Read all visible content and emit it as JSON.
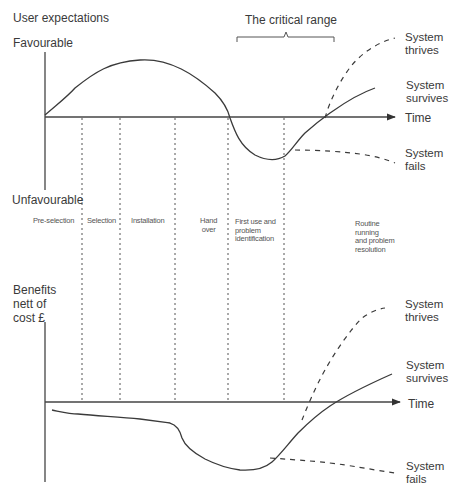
{
  "top_chart": {
    "title": "User expectations",
    "y_top_label": "Favourable",
    "y_bottom_label": "Unfavourable",
    "x_axis_label": "Time",
    "bracket_label": "The critical range",
    "outcomes": {
      "thrives": [
        "System",
        "thrives"
      ],
      "survives": [
        "System",
        "survives"
      ],
      "fails": [
        "System",
        "fails"
      ]
    }
  },
  "phases": [
    {
      "label": [
        "Pre-selection"
      ]
    },
    {
      "label": [
        "Selection"
      ]
    },
    {
      "label": [
        "Installation"
      ]
    },
    {
      "label": [
        "Hand",
        "over"
      ]
    },
    {
      "label": [
        "First use and",
        "problem",
        "identification"
      ]
    },
    {
      "label": [
        "Routine",
        "running",
        "and problem",
        "resolution"
      ]
    }
  ],
  "bottom_chart": {
    "y_label": [
      "Benefits",
      "nett of",
      "cost  £"
    ],
    "x_axis_label": "Time",
    "outcomes": {
      "thrives": [
        "System",
        "thrives"
      ],
      "survives": [
        "System",
        "survives"
      ],
      "fails": [
        "System",
        "fails"
      ]
    }
  },
  "colors": {
    "line": "#3a3a3a",
    "text": "#3a3a3a"
  }
}
